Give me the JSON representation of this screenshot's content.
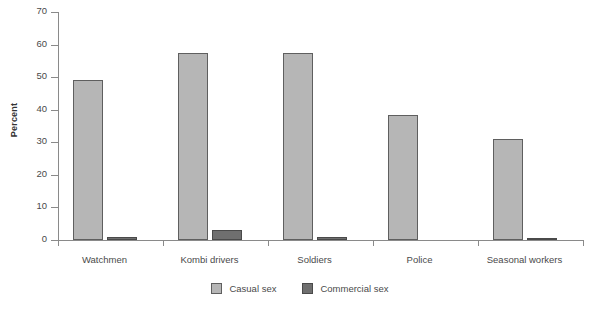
{
  "chart_data": {
    "type": "bar",
    "title": "",
    "subtitle": "",
    "xlabel": "",
    "ylabel": "Percent",
    "ylim": [
      0,
      70
    ],
    "yticks": [
      0,
      10,
      20,
      30,
      40,
      50,
      60,
      70
    ],
    "grid": false,
    "legend_position": "bottom-center",
    "categories": [
      "Watchmen",
      "Kombi drivers",
      "Soldiers",
      "Police",
      "Seasonal workers"
    ],
    "series": [
      {
        "name": "Casual sex",
        "color": "#b6b6b6",
        "values": [
          49,
          57.5,
          57.5,
          38.5,
          31
        ]
      },
      {
        "name": "Commercial sex",
        "color": "#6f6f6f",
        "values": [
          1,
          3,
          1,
          0,
          0.7
        ]
      }
    ]
  },
  "axis": {
    "y_title": "Percent"
  },
  "legend": {
    "items": [
      {
        "label": "Casual sex",
        "swatch": "casual-swatch"
      },
      {
        "label": "Commercial sex",
        "swatch": "commercial-swatch"
      }
    ]
  }
}
